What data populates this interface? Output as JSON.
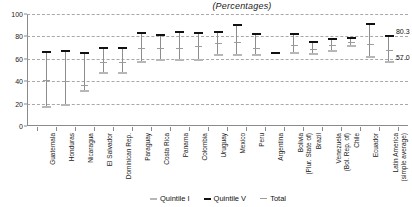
{
  "chart_data": {
    "type": "line",
    "title": "(Percentages)",
    "xlabel": "",
    "ylabel": "",
    "ylim": [
      0,
      100
    ],
    "yticks": [
      0,
      20,
      40,
      60,
      80,
      100
    ],
    "grid": true,
    "legend_position": "bottom",
    "categories": [
      "Guatemala",
      "Honduras",
      "Nicaragua",
      "El Salvador",
      "Dominican Rep.",
      "Paraguay",
      "Costa Rica",
      "Panama",
      "Colombia",
      "Uruguay",
      "Mexico",
      "Peru",
      "Argentina",
      "Bolivia (Plur. State of)",
      "Brazil",
      "Venezuela (Bol. Rep. of)",
      "Chile",
      "Ecuador",
      "Latin America (simple average)"
    ],
    "categories_lines": [
      [
        "Guatemala"
      ],
      [
        "Honduras"
      ],
      [
        "Nicaragua"
      ],
      [
        "El Salvador"
      ],
      [
        "Dominican Rep."
      ],
      [
        "Paraguay"
      ],
      [
        "Costa Rica"
      ],
      [
        "Panama"
      ],
      [
        "Colombia"
      ],
      [
        "Uruguay"
      ],
      [
        "Mexico"
      ],
      [
        "Peru"
      ],
      [
        "Argentina"
      ],
      [
        "Bolivia",
        "(Plur. State of)"
      ],
      [
        "Brazil"
      ],
      [
        "Venezuela",
        "(Bol. Rep. of)"
      ],
      [
        "Chile"
      ],
      [
        "Ecuador"
      ],
      [
        "Latin America",
        "(simple average)"
      ]
    ],
    "series": [
      {
        "name": "Quintile I",
        "color": "#b7b7b7",
        "values": [
          17,
          19,
          31,
          47,
          47,
          57,
          59,
          59,
          59,
          63,
          63,
          63,
          65,
          65,
          64,
          67,
          71,
          62,
          57.0
        ]
      },
      {
        "name": "Quintile V",
        "color": "#111111",
        "values": [
          66,
          67,
          65,
          70,
          70,
          83,
          81,
          84,
          83,
          84,
          90,
          82,
          65,
          82,
          75,
          78,
          79,
          91,
          80.3
        ]
      },
      {
        "name": "Total",
        "color": "#9c9c9c",
        "values": [
          41,
          40,
          37,
          57,
          57,
          70,
          70,
          70,
          71,
          74,
          75,
          70,
          65,
          72,
          69,
          72,
          75,
          73,
          68
        ]
      }
    ],
    "annotations": [
      {
        "text": "80.3",
        "value": 80.3,
        "series": "Quintile V",
        "category": "Latin America (simple average)"
      },
      {
        "text": "57.0",
        "value": 57.0,
        "series": "Quintile I",
        "category": "Latin America (simple average)"
      }
    ]
  },
  "legend": {
    "items": [
      {
        "label": "Quintile I",
        "color": "#b7b7b7"
      },
      {
        "label": "Quintile V",
        "color": "#111111"
      },
      {
        "label": "Total",
        "color": "#9c9c9c"
      }
    ]
  }
}
